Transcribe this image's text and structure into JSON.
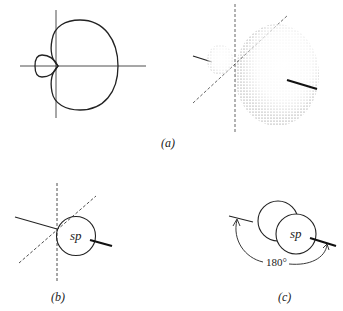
{
  "figure": {
    "panels": [
      {
        "id": "a",
        "label": "(a)",
        "description": "Polar plot of hybrid orbital (2D cross-section) and 3D shaded lobe view"
      },
      {
        "id": "b",
        "label": "(b)",
        "description": "sp hybrid orbital symbol with axes"
      },
      {
        "id": "c",
        "label": "(c)",
        "description": "Two sp hybrid orbitals oriented 180 degrees apart"
      }
    ],
    "orbital_label_b": "sp",
    "orbital_label_c": "sp",
    "angle_label": "180°",
    "colors": {
      "line": "#222222",
      "stipple": "#555555",
      "background": "#ffffff"
    }
  }
}
